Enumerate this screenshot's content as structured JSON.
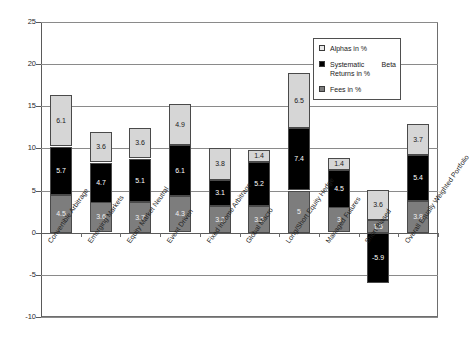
{
  "chart_data": {
    "type": "bar",
    "subtype": "stacked-bar",
    "title": "",
    "xlabel": "",
    "ylabel": "",
    "ylim": [
      -10,
      25
    ],
    "yticks": [
      25,
      20,
      15,
      10,
      5,
      0,
      -5,
      -10
    ],
    "grid": true,
    "legend_position": "top-right",
    "categories": [
      "Convertible Arbitrage",
      "Emerging Markets",
      "Equity Market Neutral",
      "Event Driven",
      "Fixed Income Arbitrage",
      "Global Macro",
      "Long/Short Equity Hedge",
      "Managed Futures",
      "Short Biased",
      "Overall Equally Weighted Portfolio"
    ],
    "series": [
      {
        "name": "Fees in %",
        "color": "#7d7d7d",
        "values": [
          4.5,
          3.6,
          3.7,
          4.3,
          3.2,
          3.2,
          5,
          3,
          1.5,
          3.8
        ],
        "labels": [
          "4.5",
          "3.6",
          "3.7",
          "4.3",
          "3.2",
          "3.2",
          "5",
          "3",
          "1.5",
          "3.8"
        ]
      },
      {
        "name": "Systematic Beta Returns in %",
        "color": "#000000",
        "values": [
          5.7,
          4.7,
          5.1,
          6.1,
          3.1,
          5.2,
          7.4,
          4.5,
          -5.9,
          5.4
        ],
        "labels": [
          "5.7",
          "4.7",
          "5.1",
          "6.1",
          "3.1",
          "5.2",
          "7.4",
          "4.5",
          "-5.9",
          "5.4"
        ]
      },
      {
        "name": "Alphas in %",
        "color": "#d6d6d6",
        "values": [
          6.1,
          3.6,
          3.6,
          4.9,
          3.8,
          1.4,
          6.5,
          1.4,
          3.6,
          3.7
        ],
        "labels": [
          "6.1",
          "3.6",
          "3.6",
          "4.9",
          "3.8",
          "1.4",
          "6.5",
          "1.4",
          "3.6",
          "3.7"
        ]
      }
    ],
    "totals_positive": [
      16.3,
      11.9,
      12.4,
      15.3,
      10.1,
      9.8,
      18.9,
      8.9,
      5.1,
      12.9
    ]
  },
  "legend": {
    "entries": [
      {
        "label": "Alphas in %",
        "swatch": "alpha"
      },
      {
        "label": "Systematic Beta Returns in %",
        "swatch": "beta"
      },
      {
        "label": "Fees in %",
        "swatch": "fees"
      }
    ]
  },
  "axis": {
    "ytick_labels": [
      "25",
      "20",
      "15",
      "10",
      "5",
      "0",
      "-5",
      "-10"
    ]
  }
}
